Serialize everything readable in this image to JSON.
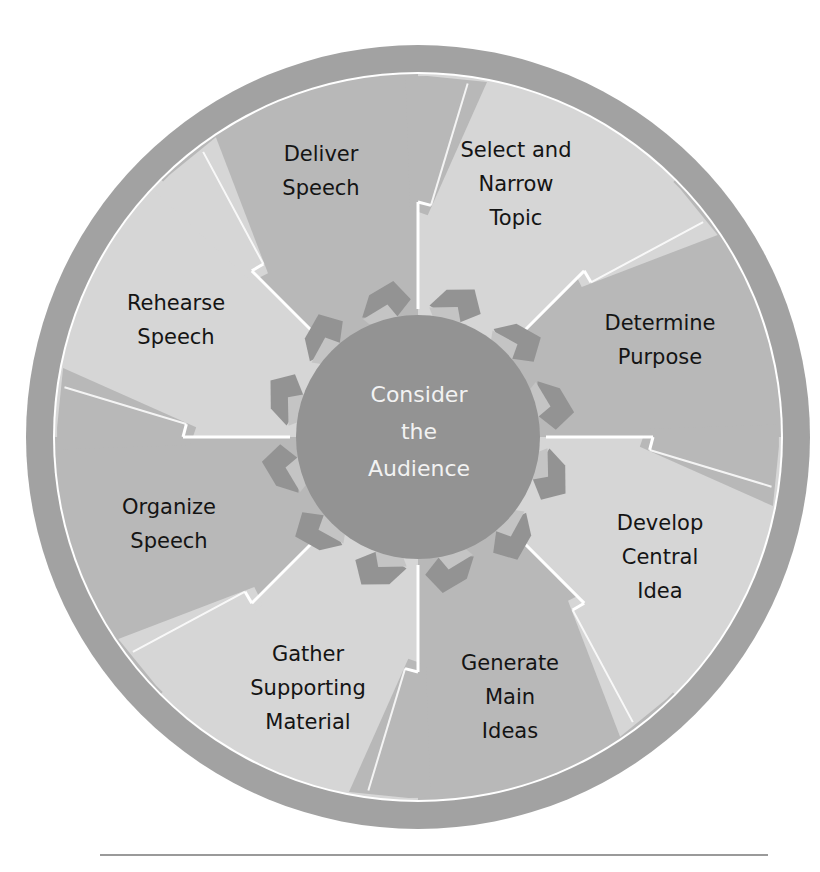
{
  "diagram": {
    "type": "cyclic-process",
    "center_label": [
      "Consider",
      "the",
      "Audience"
    ],
    "steps": [
      {
        "id": "select-topic",
        "lines": [
          "Select and",
          "Narrow",
          "Topic"
        ],
        "shade": "light",
        "label_pos": [
          516,
          157
        ]
      },
      {
        "id": "determine-purpose",
        "lines": [
          "Determine",
          "Purpose"
        ],
        "shade": "dark",
        "label_pos": [
          660,
          330
        ]
      },
      {
        "id": "develop-central-idea",
        "lines": [
          "Develop",
          "Central",
          "Idea"
        ],
        "shade": "light",
        "label_pos": [
          660,
          530
        ]
      },
      {
        "id": "generate-main-ideas",
        "lines": [
          "Generate",
          "Main",
          "Ideas"
        ],
        "shade": "dark",
        "label_pos": [
          510,
          670
        ]
      },
      {
        "id": "gather-supporting-material",
        "lines": [
          "Gather",
          "Supporting",
          "Material"
        ],
        "shade": "light",
        "label_pos": [
          308,
          661
        ]
      },
      {
        "id": "organize-speech",
        "lines": [
          "Organize",
          "Speech"
        ],
        "shade": "dark",
        "label_pos": [
          169,
          514
        ]
      },
      {
        "id": "rehearse-speech",
        "lines": [
          "Rehearse",
          "Speech"
        ],
        "shade": "light",
        "label_pos": [
          176,
          310
        ]
      },
      {
        "id": "deliver-speech",
        "lines": [
          "Deliver",
          "Speech"
        ],
        "shade": "dark",
        "label_pos": [
          321,
          161
        ]
      }
    ],
    "colors": {
      "outer_ring": "#a2a2a2",
      "sector_light": "#d6d6d6",
      "sector_dark": "#b8b8b8",
      "hub": "#939393",
      "hub_arrow_light": "#c4c4c4",
      "divider": "#ffffff",
      "label_text": "#141414",
      "hub_text": "#f2f2f2"
    }
  }
}
